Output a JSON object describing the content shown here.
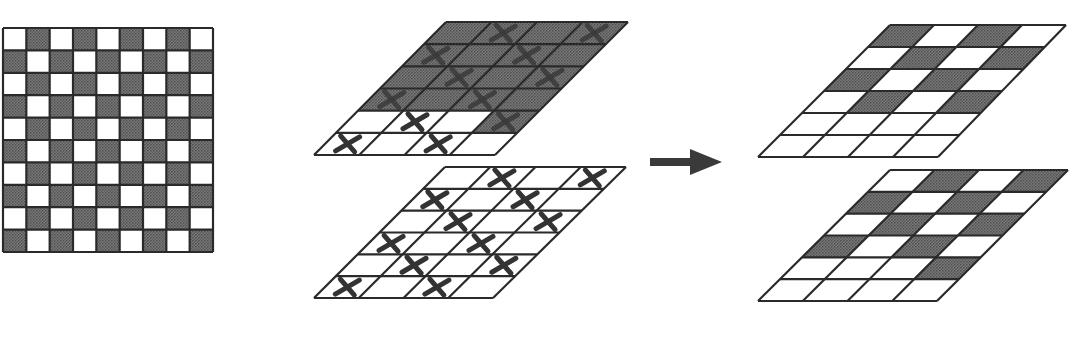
{
  "diagram": {
    "title": "",
    "background": "#ffffff",
    "colors": {
      "dark_cell": "#6e6e6e",
      "dark_cell_dot": "#4a4a4a",
      "white_cell": "#ffffff",
      "line": "#2a2a2a",
      "xmark": "#333333",
      "arrow": "#3a3a3a"
    },
    "checkerboard": {
      "name": "source-checkerboard",
      "x": 3,
      "y": 28,
      "width": 210,
      "height": 224,
      "cols": 9,
      "rows": 10,
      "first_cell": "white",
      "note": "alternating dark/white 9x10 checkerboard, left edge cropped"
    },
    "panels": [
      {
        "name": "input-layer-top",
        "cols": 4,
        "rows": 6,
        "top_left": [
          446,
          22
        ],
        "top_right": [
          628,
          22
        ],
        "bottom_left": [
          314,
          155
        ],
        "bottom_right": [
          495,
          155
        ],
        "shading": [
          [
            1,
            1,
            1,
            1
          ],
          [
            1,
            1,
            1,
            1
          ],
          [
            1,
            1,
            1,
            1
          ],
          [
            1,
            1,
            1,
            1
          ],
          [
            0,
            0,
            0,
            1
          ],
          [
            0,
            0,
            0,
            0
          ]
        ],
        "xmarks": [
          [
            0,
            1,
            0,
            1
          ],
          [
            1,
            0,
            1,
            0
          ],
          [
            0,
            1,
            0,
            1
          ],
          [
            1,
            0,
            1,
            0
          ],
          [
            0,
            1,
            0,
            1
          ],
          [
            1,
            0,
            1,
            0
          ]
        ]
      },
      {
        "name": "input-layer-bottom",
        "cols": 4,
        "rows": 6,
        "top_left": [
          445,
          167
        ],
        "top_right": [
          626,
          167
        ],
        "bottom_left": [
          314,
          298
        ],
        "bottom_right": [
          493,
          298
        ],
        "shading": [
          [
            0,
            0,
            0,
            0
          ],
          [
            0,
            0,
            0,
            0
          ],
          [
            0,
            0,
            0,
            0
          ],
          [
            0,
            0,
            0,
            0
          ],
          [
            0,
            0,
            0,
            0
          ],
          [
            0,
            0,
            0,
            0
          ]
        ],
        "xmarks": [
          [
            0,
            1,
            0,
            1
          ],
          [
            1,
            0,
            1,
            0
          ],
          [
            0,
            1,
            0,
            1
          ],
          [
            1,
            0,
            1,
            0
          ],
          [
            0,
            1,
            0,
            1
          ],
          [
            1,
            0,
            1,
            0
          ]
        ]
      },
      {
        "name": "output-layer-top",
        "cols": 4,
        "rows": 6,
        "top_left": [
          890,
          25
        ],
        "top_right": [
          1066,
          25
        ],
        "bottom_left": [
          758,
          157
        ],
        "bottom_right": [
          938,
          157
        ],
        "shading": [
          [
            1,
            0,
            1,
            0
          ],
          [
            0,
            1,
            0,
            1
          ],
          [
            1,
            0,
            1,
            0
          ],
          [
            0,
            1,
            0,
            1
          ],
          [
            0,
            0,
            0,
            0
          ],
          [
            0,
            0,
            0,
            0
          ]
        ],
        "xmarks": [
          [
            0,
            0,
            0,
            0
          ],
          [
            0,
            0,
            0,
            0
          ],
          [
            0,
            0,
            0,
            0
          ],
          [
            0,
            0,
            0,
            0
          ],
          [
            0,
            0,
            0,
            0
          ],
          [
            0,
            0,
            0,
            0
          ]
        ]
      },
      {
        "name": "output-layer-bottom",
        "cols": 4,
        "rows": 6,
        "top_left": [
          890,
          170
        ],
        "top_right": [
          1068,
          170
        ],
        "bottom_left": [
          758,
          301
        ],
        "bottom_right": [
          937,
          301
        ],
        "shading": [
          [
            0,
            1,
            0,
            1
          ],
          [
            1,
            0,
            1,
            0
          ],
          [
            0,
            1,
            0,
            1
          ],
          [
            1,
            0,
            1,
            0
          ],
          [
            0,
            0,
            0,
            1
          ],
          [
            0,
            0,
            0,
            0
          ]
        ],
        "xmarks": [
          [
            0,
            0,
            0,
            0
          ],
          [
            0,
            0,
            0,
            0
          ],
          [
            0,
            0,
            0,
            0
          ],
          [
            0,
            0,
            0,
            0
          ],
          [
            0,
            0,
            0,
            0
          ],
          [
            0,
            0,
            0,
            0
          ]
        ]
      }
    ],
    "arrow": {
      "name": "transform-arrow",
      "direction": "right",
      "x1": 650,
      "y": 162,
      "head_start": 690,
      "x2": 722,
      "shaft_thickness": 8,
      "head_height": 26
    },
    "icons": {
      "xmark": "x-mark-icon",
      "arrow": "arrow-right-icon"
    }
  }
}
